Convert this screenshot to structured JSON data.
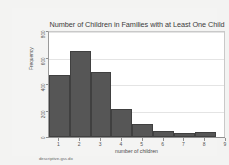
{
  "chart_data": {
    "type": "bar",
    "title": "Number of Children in Families with at Least One Child",
    "xlabel": "number of children",
    "ylabel": "Frequency",
    "categories": [
      "1",
      "2",
      "3",
      "4",
      "5",
      "6",
      "7",
      "8"
    ],
    "values": [
      470,
      650,
      490,
      215,
      95,
      45,
      28,
      38
    ],
    "x_ticks": [
      "1",
      "2",
      "3",
      "4",
      "5",
      "6",
      "7",
      "8",
      "9"
    ],
    "y_ticks": [
      "0",
      "200",
      "400",
      "600",
      "800"
    ],
    "ylim": [
      0,
      800
    ],
    "xlim": [
      0.5,
      9.0
    ],
    "grid": true,
    "legend": false,
    "bar_color": "#565656",
    "bar_edge_color": "#404040",
    "plot_background": "#ffffff",
    "figure_background": "#f3f3f2"
  },
  "footnote": "descriptive-gss.do"
}
